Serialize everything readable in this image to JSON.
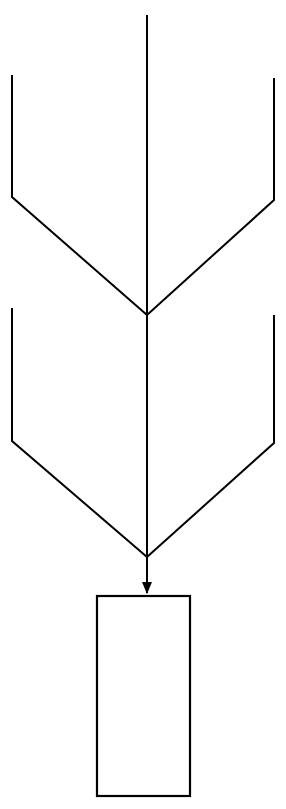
{
  "canvas": {
    "width": 286,
    "height": 809,
    "background_color": "#ffffff",
    "stroke_color": "#000000",
    "stroke_width": 2
  },
  "diagram": {
    "type": "merge-flowchart",
    "center_axis_x": 147,
    "trunk": {
      "name": "center-trunk",
      "x": 147,
      "y_top": 15,
      "y_bottom": 593
    },
    "branches": [
      {
        "name": "outer-left-branch",
        "vertical_x": 12,
        "vertical_y_top": 75,
        "vertical_y_bottom": 197,
        "merge_x": 147,
        "merge_y": 315
      },
      {
        "name": "outer-right-branch",
        "vertical_x": 274,
        "vertical_y_top": 78,
        "vertical_y_bottom": 200,
        "merge_x": 147,
        "merge_y": 315
      },
      {
        "name": "inner-left-branch",
        "vertical_x": 12,
        "vertical_y_top": 308,
        "vertical_y_bottom": 441,
        "merge_x": 147,
        "merge_y": 557
      },
      {
        "name": "inner-right-branch",
        "vertical_x": 274,
        "vertical_y_top": 315,
        "vertical_y_bottom": 443,
        "merge_x": 147,
        "merge_y": 557
      }
    ],
    "merge_points": [
      {
        "name": "upper-merge-point",
        "x": 147,
        "y": 315
      },
      {
        "name": "lower-merge-point",
        "x": 147,
        "y": 557
      }
    ],
    "arrow": {
      "name": "trunk-arrowhead",
      "tip_x": 147,
      "tip_y": 594,
      "half_width": 5,
      "length": 12,
      "direction": "down"
    },
    "box": {
      "name": "terminal-node",
      "x": 97,
      "y": 596,
      "width": 93,
      "height": 200,
      "label": "",
      "fill": "none",
      "stroke": "#000000"
    }
  }
}
